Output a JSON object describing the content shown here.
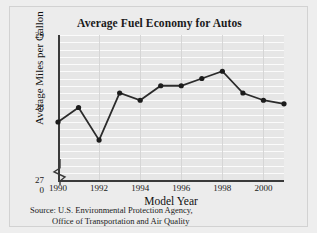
{
  "figure": {
    "title": "Average Fuel Economy for Autos",
    "source_line1": "Source: U.S. Environmental Protection Agency,",
    "source_line2": "Office of Transportation and Air Quality"
  },
  "axes": {
    "y_label": "Average Miles per Gallon",
    "x_label": "Model Year",
    "y_ticks": [
      "29",
      "28",
      "27",
      "0"
    ],
    "x_ticks": [
      "1990",
      "1992",
      "1994",
      "1996",
      "1998",
      "2000"
    ]
  },
  "colors": {
    "figure_background": "#eeeeee",
    "plot_background": "#e6e6e6",
    "horizontal_gridline": "#fbfbfb",
    "vertical_gridline": "#d6d6d6",
    "axis": "#3a3a3a",
    "line": "#2b2b2b",
    "marker": "#1c1c1c",
    "text": "#1a1a1a"
  },
  "chart_data": {
    "type": "line",
    "title": "Average Fuel Economy for Autos",
    "xlabel": "Model Year",
    "ylabel": "Average Miles per Gallon",
    "x": [
      1990,
      1991,
      1992,
      1993,
      1994,
      1995,
      1996,
      1997,
      1998,
      1999,
      2000,
      2001
    ],
    "values": [
      27.8,
      28.0,
      27.55,
      28.2,
      28.1,
      28.3,
      28.3,
      28.4,
      28.5,
      28.2,
      28.1,
      28.05
    ],
    "xlim": [
      1990,
      2001
    ],
    "ylim": [
      27.0,
      29.0
    ],
    "y_axis_break_below": 27.0,
    "y_tick_values": [
      29,
      28,
      27,
      0
    ],
    "x_tick_values": [
      1990,
      1992,
      1994,
      1996,
      1998,
      2000
    ],
    "grid": true,
    "legend": false,
    "markers": "filled-circle"
  }
}
